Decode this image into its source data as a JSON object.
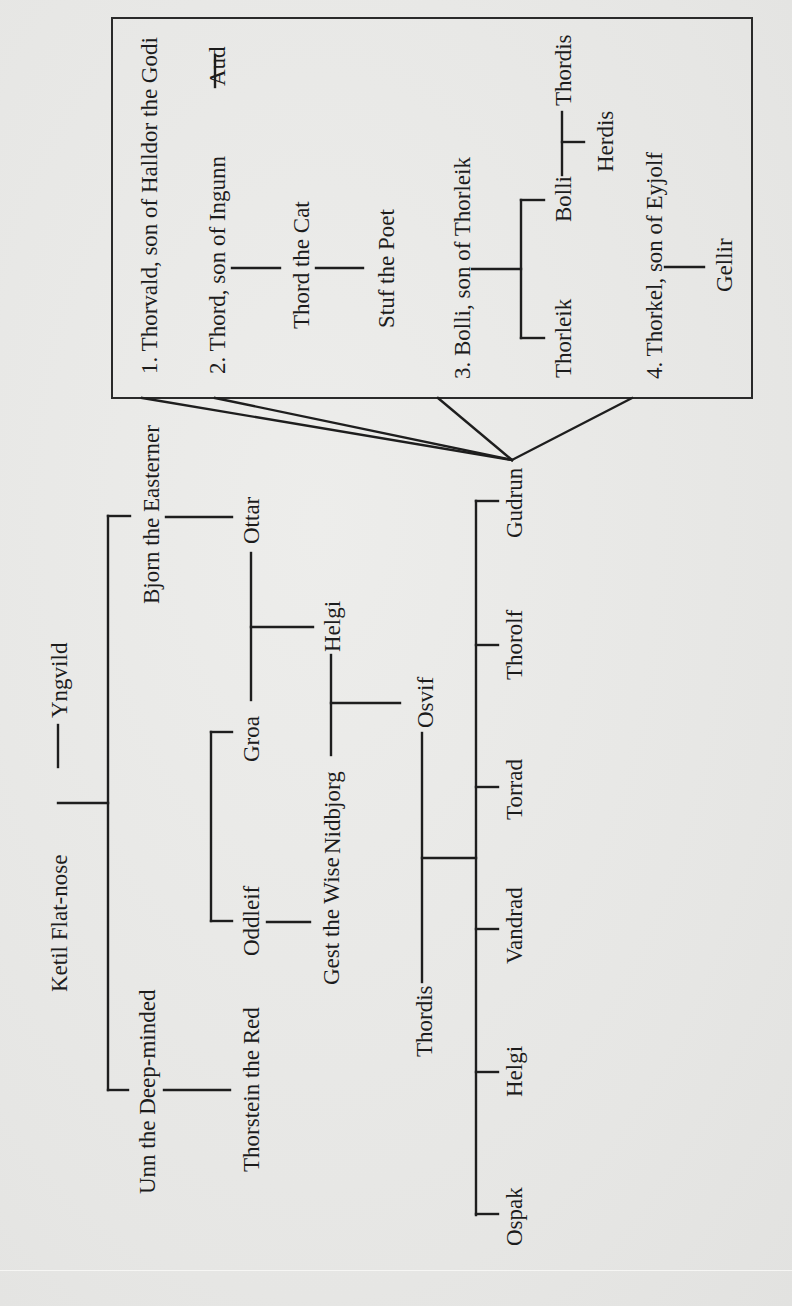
{
  "diagram": {
    "type": "genealogy",
    "orientation": "rotated-90-ccw",
    "colors": {
      "ink": "#1e1e1e",
      "paper": "#e9e9e7"
    },
    "persons": {
      "ketil": "Ketil Flat-nose",
      "yngvild": "Yngvild",
      "bjorn": "Bjorn the Easterner",
      "unn": "Unn the Deep-minded",
      "ottar": "Ottar",
      "groa": "Groa",
      "helgi_ottarsson": "Helgi",
      "nidbjorg": "Nidbjorg",
      "oddleif": "Oddleif",
      "gest": "Gest the Wise",
      "thorstein": "Thorstein the Red",
      "osvif": "Osvif",
      "thordis_mother": "Thordis",
      "gudrun": "Gudrun",
      "thorolf": "Thorolf",
      "torrad": "Torrad",
      "vandrad": "Vandrad",
      "helgi_osvifsson": "Helgi",
      "ospak": "Ospak"
    },
    "husbands_box": {
      "h1": "1. Thorvald, son of Halldor the Godi",
      "h2": "2. Thord, son of Ingunn",
      "aud": "Aud",
      "thord_cat": "Thord the Cat",
      "stuf": "Stuf the Poet",
      "h3": "3. Bolli, son of Thorleik",
      "thorleik": "Thorleik",
      "bolli": "Bolli",
      "thordis_wife": "Thordis",
      "herdis": "Herdis",
      "h4": "4. Thorkel, son of Eyjolf",
      "gellir": "Gellir"
    },
    "relations": [
      {
        "type": "marriage",
        "a": "Ketil Flat-nose",
        "b": "Yngvild"
      },
      {
        "type": "children",
        "parents": "Ketil Flat-nose & Yngvild",
        "children": [
          "Bjorn the Easterner",
          "Unn the Deep-minded"
        ]
      },
      {
        "type": "child",
        "parent": "Bjorn the Easterner",
        "child": "Ottar"
      },
      {
        "type": "children",
        "parent": "Ottar",
        "children": [
          "Helgi",
          "Groa"
        ]
      },
      {
        "type": "children",
        "parent": "Groa",
        "children": [
          "Oddleif"
        ]
      },
      {
        "type": "child",
        "parent": "Oddleif",
        "child": "Gest the Wise"
      },
      {
        "type": "child",
        "parent": "Unn the Deep-minded",
        "child": "Thorstein the Red"
      },
      {
        "type": "marriage",
        "a": "Helgi",
        "b": "Nidbjorg"
      },
      {
        "type": "child",
        "parents": "Helgi & Nidbjorg",
        "child": "Osvif"
      },
      {
        "type": "marriage",
        "a": "Osvif",
        "b": "Thordis"
      },
      {
        "type": "children",
        "parents": "Osvif & Thordis",
        "children": [
          "Gudrun",
          "Thorolf",
          "Torrad",
          "Vandrad",
          "Helgi",
          "Ospak"
        ]
      },
      {
        "type": "husbands",
        "of": "Gudrun",
        "list": [
          "Thorvald, son of Halldor the Godi",
          "Thord, son of Ingunn",
          "Bolli, son of Thorleik",
          "Thorkel, son of Eyjolf"
        ]
      },
      {
        "type": "marriage",
        "a": "Thord, son of Ingunn",
        "b": "Aud"
      },
      {
        "type": "child",
        "parent": "Thord, son of Ingunn",
        "child": "Thord the Cat"
      },
      {
        "type": "child",
        "parent": "Thord the Cat",
        "child": "Stuf the Poet"
      },
      {
        "type": "children",
        "parent": "Bolli, son of Thorleik",
        "children": [
          "Thorleik",
          "Bolli"
        ]
      },
      {
        "type": "marriage",
        "a": "Bolli",
        "b": "Thordis"
      },
      {
        "type": "child",
        "parents": "Bolli & Thordis",
        "child": "Herdis"
      },
      {
        "type": "child",
        "parent": "Thorkel, son of Eyjolf",
        "child": "Gellir"
      }
    ]
  }
}
